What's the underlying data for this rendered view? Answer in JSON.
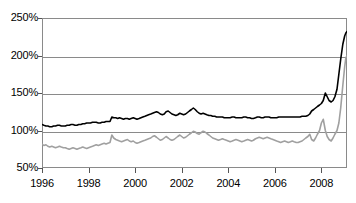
{
  "chart_data": {
    "type": "line",
    "title": "",
    "subtitle": "",
    "xlabel": "",
    "ylabel": "",
    "xlim": [
      1996,
      2009.1
    ],
    "ylim": [
      50,
      250
    ],
    "grid": true,
    "legend_position": "none",
    "y_tick_labels": [
      "250%",
      "200%",
      "150%",
      "100%",
      "50%"
    ],
    "y_tick_values": [
      250,
      200,
      150,
      100,
      50
    ],
    "x_tick_labels": [
      "1996",
      "1998",
      "2000",
      "2002",
      "2004",
      "2006",
      "2008"
    ],
    "x_tick_values": [
      1996,
      1998,
      2000,
      2002,
      2004,
      2006,
      2008
    ],
    "colors": {
      "series_1": "#000000",
      "series_2": "#a0a0a0",
      "axis": "#8a8a8a",
      "grid": "#8a8a8a"
    },
    "series": [
      {
        "name": "series-black",
        "color": "#000000",
        "x": [
          1996.0,
          1996.08,
          1996.17,
          1996.25,
          1996.33,
          1996.42,
          1996.5,
          1996.58,
          1996.67,
          1996.75,
          1996.83,
          1996.92,
          1997.0,
          1997.08,
          1997.17,
          1997.25,
          1997.33,
          1997.42,
          1997.5,
          1997.58,
          1997.67,
          1997.75,
          1997.83,
          1997.92,
          1998.0,
          1998.08,
          1998.17,
          1998.25,
          1998.33,
          1998.42,
          1998.5,
          1998.58,
          1998.67,
          1998.75,
          1998.83,
          1998.92,
          1999.0,
          1999.08,
          1999.17,
          1999.25,
          1999.33,
          1999.42,
          1999.5,
          1999.58,
          1999.67,
          1999.75,
          1999.83,
          1999.92,
          2000.0,
          2000.08,
          2000.17,
          2000.25,
          2000.33,
          2000.42,
          2000.5,
          2000.58,
          2000.67,
          2000.75,
          2000.83,
          2000.92,
          2001.0,
          2001.08,
          2001.17,
          2001.25,
          2001.33,
          2001.42,
          2001.5,
          2001.58,
          2001.67,
          2001.75,
          2001.83,
          2001.92,
          2002.0,
          2002.08,
          2002.17,
          2002.25,
          2002.33,
          2002.42,
          2002.5,
          2002.58,
          2002.67,
          2002.75,
          2002.83,
          2002.92,
          2003.0,
          2003.08,
          2003.17,
          2003.25,
          2003.33,
          2003.42,
          2003.5,
          2003.58,
          2003.67,
          2003.75,
          2003.83,
          2003.92,
          2004.0,
          2004.08,
          2004.17,
          2004.25,
          2004.33,
          2004.42,
          2004.5,
          2004.58,
          2004.67,
          2004.75,
          2004.83,
          2004.92,
          2005.0,
          2005.08,
          2005.17,
          2005.25,
          2005.33,
          2005.42,
          2005.5,
          2005.58,
          2005.67,
          2005.75,
          2005.83,
          2005.92,
          2006.0,
          2006.08,
          2006.17,
          2006.25,
          2006.33,
          2006.42,
          2006.5,
          2006.58,
          2006.67,
          2006.75,
          2006.83,
          2006.92,
          2007.0,
          2007.08,
          2007.17,
          2007.25,
          2007.33,
          2007.42,
          2007.5,
          2007.58,
          2007.67,
          2007.75,
          2007.83,
          2007.92,
          2008.0,
          2008.08,
          2008.17,
          2008.25,
          2008.33,
          2008.42,
          2008.5,
          2008.58,
          2008.67,
          2008.75,
          2008.83,
          2008.92,
          2009.0,
          2009.05,
          2009.1
        ],
        "values": [
          108,
          107,
          106,
          106,
          105,
          105,
          106,
          106,
          107,
          107,
          106,
          106,
          106,
          107,
          107,
          108,
          108,
          107,
          107,
          108,
          108,
          109,
          109,
          110,
          110,
          110,
          111,
          111,
          111,
          110,
          110,
          111,
          111,
          112,
          112,
          112,
          118,
          117,
          117,
          116,
          117,
          116,
          115,
          116,
          116,
          115,
          116,
          117,
          116,
          115,
          116,
          117,
          118,
          119,
          120,
          121,
          122,
          123,
          124,
          125,
          124,
          122,
          121,
          122,
          125,
          126,
          124,
          122,
          121,
          120,
          121,
          123,
          122,
          121,
          122,
          124,
          126,
          128,
          130,
          128,
          125,
          123,
          122,
          123,
          122,
          121,
          120,
          120,
          119,
          119,
          118,
          118,
          118,
          118,
          117,
          117,
          117,
          117,
          118,
          118,
          117,
          117,
          117,
          117,
          118,
          118,
          117,
          117,
          116,
          116,
          117,
          118,
          118,
          117,
          117,
          118,
          118,
          118,
          117,
          117,
          117,
          117,
          118,
          118,
          118,
          118,
          118,
          118,
          118,
          118,
          118,
          118,
          118,
          118,
          119,
          119,
          119,
          120,
          122,
          126,
          128,
          130,
          132,
          134,
          136,
          140,
          150,
          145,
          140,
          138,
          140,
          145,
          155,
          175,
          195,
          215,
          226,
          230,
          232
        ]
      },
      {
        "name": "series-gray",
        "color": "#a0a0a0",
        "x": [
          1996.0,
          1996.08,
          1996.17,
          1996.25,
          1996.33,
          1996.42,
          1996.5,
          1996.58,
          1996.67,
          1996.75,
          1996.83,
          1996.92,
          1997.0,
          1997.08,
          1997.17,
          1997.25,
          1997.33,
          1997.42,
          1997.5,
          1997.58,
          1997.67,
          1997.75,
          1997.83,
          1997.92,
          1998.0,
          1998.08,
          1998.17,
          1998.25,
          1998.33,
          1998.42,
          1998.5,
          1998.58,
          1998.67,
          1998.75,
          1998.83,
          1998.92,
          1999.0,
          1999.08,
          1999.17,
          1999.25,
          1999.33,
          1999.42,
          1999.5,
          1999.58,
          1999.67,
          1999.75,
          1999.83,
          1999.92,
          2000.0,
          2000.08,
          2000.17,
          2000.25,
          2000.33,
          2000.42,
          2000.5,
          2000.58,
          2000.67,
          2000.75,
          2000.83,
          2000.92,
          2001.0,
          2001.08,
          2001.17,
          2001.25,
          2001.33,
          2001.42,
          2001.5,
          2001.58,
          2001.67,
          2001.75,
          2001.83,
          2001.92,
          2002.0,
          2002.08,
          2002.17,
          2002.25,
          2002.33,
          2002.42,
          2002.5,
          2002.58,
          2002.67,
          2002.75,
          2002.83,
          2002.92,
          2003.0,
          2003.08,
          2003.17,
          2003.25,
          2003.33,
          2003.42,
          2003.5,
          2003.58,
          2003.67,
          2003.75,
          2003.83,
          2003.92,
          2004.0,
          2004.08,
          2004.17,
          2004.25,
          2004.33,
          2004.42,
          2004.5,
          2004.58,
          2004.67,
          2004.75,
          2004.83,
          2004.92,
          2005.0,
          2005.08,
          2005.17,
          2005.25,
          2005.33,
          2005.42,
          2005.5,
          2005.58,
          2005.67,
          2005.75,
          2005.83,
          2005.92,
          2006.0,
          2006.08,
          2006.17,
          2006.25,
          2006.33,
          2006.42,
          2006.5,
          2006.58,
          2006.67,
          2006.75,
          2006.83,
          2006.92,
          2007.0,
          2007.08,
          2007.17,
          2007.25,
          2007.33,
          2007.42,
          2007.5,
          2007.58,
          2007.67,
          2007.75,
          2007.83,
          2007.92,
          2008.0,
          2008.08,
          2008.17,
          2008.25,
          2008.33,
          2008.42,
          2008.5,
          2008.58,
          2008.67,
          2008.75,
          2008.83,
          2008.92,
          2009.0,
          2009.05,
          2009.1
        ],
        "values": [
          82,
          80,
          81,
          79,
          78,
          79,
          78,
          77,
          78,
          79,
          78,
          77,
          77,
          76,
          75,
          76,
          77,
          76,
          75,
          76,
          77,
          78,
          77,
          76,
          77,
          78,
          79,
          80,
          81,
          80,
          81,
          82,
          83,
          82,
          83,
          84,
          94,
          90,
          88,
          87,
          86,
          85,
          86,
          87,
          88,
          86,
          85,
          86,
          84,
          83,
          84,
          85,
          86,
          87,
          88,
          89,
          90,
          92,
          93,
          91,
          89,
          87,
          88,
          90,
          92,
          90,
          88,
          87,
          88,
          90,
          92,
          94,
          92,
          90,
          91,
          93,
          95,
          97,
          99,
          98,
          96,
          95,
          97,
          99,
          98,
          96,
          94,
          92,
          90,
          89,
          88,
          87,
          88,
          89,
          88,
          87,
          86,
          85,
          86,
          87,
          88,
          87,
          86,
          85,
          86,
          87,
          88,
          87,
          86,
          87,
          89,
          90,
          91,
          90,
          89,
          90,
          91,
          90,
          89,
          88,
          87,
          86,
          85,
          84,
          85,
          86,
          85,
          84,
          85,
          86,
          85,
          84,
          84,
          85,
          86,
          88,
          90,
          92,
          95,
          88,
          86,
          90,
          95,
          100,
          110,
          115,
          100,
          92,
          88,
          86,
          90,
          95,
          100,
          110,
          130,
          160,
          185,
          197,
          200
        ]
      }
    ]
  }
}
